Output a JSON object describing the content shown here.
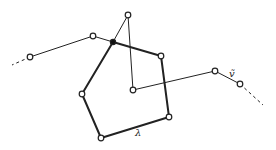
{
  "diagram": {
    "width": 276,
    "height": 150,
    "colors": {
      "background": "#ffffff",
      "stroke": "#222222",
      "node_fill_open": "#ffffff",
      "node_fill_filled": "#111111"
    },
    "nodes": [
      {
        "id": "A",
        "x": 30,
        "y": 57,
        "type": "open"
      },
      {
        "id": "B",
        "x": 93,
        "y": 36,
        "type": "open"
      },
      {
        "id": "J",
        "x": 113,
        "y": 42,
        "type": "filled"
      },
      {
        "id": "T",
        "x": 128,
        "y": 15,
        "type": "open"
      },
      {
        "id": "C",
        "x": 161,
        "y": 56,
        "type": "open"
      },
      {
        "id": "D",
        "x": 169,
        "y": 117,
        "type": "open"
      },
      {
        "id": "E",
        "x": 101,
        "y": 138,
        "type": "open"
      },
      {
        "id": "F",
        "x": 82,
        "y": 94,
        "type": "open"
      },
      {
        "id": "I",
        "x": 133,
        "y": 90,
        "type": "open"
      },
      {
        "id": "R",
        "x": 215,
        "y": 71,
        "type": "open"
      },
      {
        "id": "S",
        "x": 240,
        "y": 84,
        "type": "open"
      }
    ],
    "edges": [
      {
        "from": "A",
        "to": "B",
        "style": "thin"
      },
      {
        "from": "B",
        "to": "J",
        "style": "thin"
      },
      {
        "from": "J",
        "to": "T",
        "style": "thin"
      },
      {
        "from": "T",
        "to": "I",
        "style": "thin"
      },
      {
        "from": "I",
        "to": "R",
        "style": "thin"
      },
      {
        "from": "R",
        "to": "S",
        "style": "thin"
      },
      {
        "from": "J",
        "to": "C",
        "style": "thick"
      },
      {
        "from": "C",
        "to": "D",
        "style": "thick"
      },
      {
        "from": "D",
        "to": "E",
        "style": "thick"
      },
      {
        "from": "E",
        "to": "F",
        "style": "thick"
      },
      {
        "from": "F",
        "to": "J",
        "style": "thick"
      }
    ],
    "dashed_ends": [
      {
        "x1": 30,
        "y1": 57,
        "x2": 12,
        "y2": 65
      },
      {
        "x1": 240,
        "y1": 84,
        "x2": 263,
        "y2": 105
      }
    ],
    "labels": [
      {
        "id": "v-tilde",
        "text": "ṽ",
        "x": 229,
        "y": 77,
        "size": 10
      },
      {
        "id": "lambda",
        "text": "λ",
        "x": 135,
        "y": 136,
        "size": 10
      }
    ]
  }
}
